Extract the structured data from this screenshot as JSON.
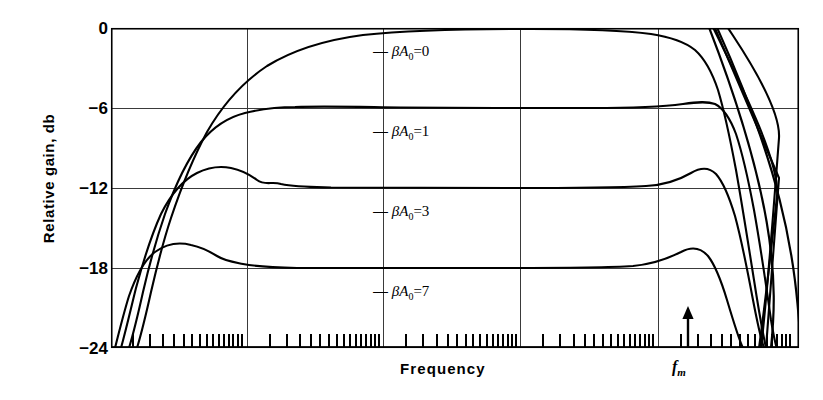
{
  "chart_data": {
    "type": "line",
    "title": "",
    "xlabel": "Frequency",
    "ylabel": "Relative gain, db",
    "x_scale": "log",
    "xlim": [
      0,
      1
    ],
    "ylim": [
      -24,
      0
    ],
    "yticks": [
      0,
      -6,
      -12,
      -18,
      -24
    ],
    "ytick_labels": [
      "0",
      "−6",
      "−12",
      "−18",
      "−24"
    ],
    "grid": "major gridlines on both axes; minor log ticks on x axis only",
    "legend": "inline curve labels placed at the right of each plateau",
    "annotations": [
      {
        "name": "fm-marker",
        "label": "f_m",
        "text": "f",
        "sub": "m",
        "arrow": "up",
        "x_px": 686,
        "note": "upward arrow at the resonance/cutoff frequency f sub m"
      }
    ],
    "series": [
      {
        "name": "−βA₀ = 0",
        "beta_a0": 0,
        "plateau_db": 0,
        "label": "−βA₀=0",
        "label_x_px": 373,
        "label_y_px": 42,
        "points_db": [
          {
            "x": 0.055,
            "y": -24.0
          },
          {
            "x": 0.075,
            "y": -18.0
          },
          {
            "x": 0.095,
            "y": -12.0
          },
          {
            "x": 0.12,
            "y": -7.0
          },
          {
            "x": 0.15,
            "y": -4.0
          },
          {
            "x": 0.2,
            "y": -1.8
          },
          {
            "x": 0.27,
            "y": -0.6
          },
          {
            "x": 0.36,
            "y": -0.1
          },
          {
            "x": 0.5,
            "y": 0.0
          },
          {
            "x": 0.65,
            "y": 0.0
          },
          {
            "x": 0.76,
            "y": -0.3
          },
          {
            "x": 0.81,
            "y": -1.2
          },
          {
            "x": 0.845,
            "y": -3.0
          },
          {
            "x": 0.872,
            "y": -6.0
          },
          {
            "x": 0.9,
            "y": -11.0
          },
          {
            "x": 0.93,
            "y": -18.0
          },
          {
            "x": 0.955,
            "y": -24.0
          }
        ]
      },
      {
        "name": "−βA₀ = 1",
        "beta_a0": 1,
        "plateau_db": -6,
        "label": "−βA₀=1",
        "label_x_px": 373,
        "label_y_px": 122,
        "points_db": [
          {
            "x": 0.05,
            "y": -24.0
          },
          {
            "x": 0.068,
            "y": -18.0
          },
          {
            "x": 0.086,
            "y": -12.0
          },
          {
            "x": 0.105,
            "y": -8.0
          },
          {
            "x": 0.125,
            "y": -6.3
          },
          {
            "x": 0.15,
            "y": -5.9
          },
          {
            "x": 0.2,
            "y": -5.9
          },
          {
            "x": 0.3,
            "y": -6.0
          },
          {
            "x": 0.5,
            "y": -6.0
          },
          {
            "x": 0.7,
            "y": -6.0
          },
          {
            "x": 0.78,
            "y": -5.9
          },
          {
            "x": 0.83,
            "y": -5.6
          },
          {
            "x": 0.862,
            "y": -6.2
          },
          {
            "x": 0.888,
            "y": -9.0
          },
          {
            "x": 0.91,
            "y": -14.0
          },
          {
            "x": 0.935,
            "y": -20.0
          },
          {
            "x": 0.952,
            "y": -24.0
          }
        ]
      },
      {
        "name": "−βA₀ = 3",
        "beta_a0": 3,
        "plateau_db": -12,
        "label": "−βA₀=3",
        "label_x_px": 373,
        "label_y_px": 202,
        "points_db": [
          {
            "x": 0.046,
            "y": -24.0
          },
          {
            "x": 0.062,
            "y": -18.0
          },
          {
            "x": 0.078,
            "y": -14.0
          },
          {
            "x": 0.092,
            "y": -11.2
          },
          {
            "x": 0.105,
            "y": -10.4
          },
          {
            "x": 0.12,
            "y": -10.5
          },
          {
            "x": 0.145,
            "y": -11.2
          },
          {
            "x": 0.19,
            "y": -11.8
          },
          {
            "x": 0.28,
            "y": -12.0
          },
          {
            "x": 0.5,
            "y": -12.0
          },
          {
            "x": 0.72,
            "y": -12.0
          },
          {
            "x": 0.79,
            "y": -11.6
          },
          {
            "x": 0.835,
            "y": -10.4
          },
          {
            "x": 0.862,
            "y": -10.6
          },
          {
            "x": 0.885,
            "y": -13.0
          },
          {
            "x": 0.905,
            "y": -17.0
          },
          {
            "x": 0.93,
            "y": -22.0
          },
          {
            "x": 0.945,
            "y": -24.0
          }
        ]
      },
      {
        "name": "−βA₀ = 7",
        "beta_a0": 7,
        "plateau_db": -18,
        "label": "−βA₀=7",
        "label_x_px": 373,
        "label_y_px": 282,
        "points_db": [
          {
            "x": 0.042,
            "y": -24.0
          },
          {
            "x": 0.056,
            "y": -20.0
          },
          {
            "x": 0.068,
            "y": -17.6
          },
          {
            "x": 0.08,
            "y": -16.8
          },
          {
            "x": 0.095,
            "y": -16.9
          },
          {
            "x": 0.115,
            "y": -17.4
          },
          {
            "x": 0.15,
            "y": -17.9
          },
          {
            "x": 0.22,
            "y": -18.0
          },
          {
            "x": 0.4,
            "y": -18.0
          },
          {
            "x": 0.65,
            "y": -18.0
          },
          {
            "x": 0.76,
            "y": -17.7
          },
          {
            "x": 0.82,
            "y": -16.9
          },
          {
            "x": 0.855,
            "y": -17.2
          },
          {
            "x": 0.88,
            "y": -19.5
          },
          {
            "x": 0.905,
            "y": -23.0
          },
          {
            "x": 0.918,
            "y": -24.0
          }
        ]
      },
      {
        "name": "resonant peak near f_m (left branch)",
        "beta_a0": null,
        "label": "",
        "note": "near-vertical rise through the top of the frame just left of f_m",
        "points_db": [
          {
            "x": 0.928,
            "y": -24.0
          },
          {
            "x": 0.944,
            "y": -12.0
          },
          {
            "x": 0.95,
            "y": -4.0
          },
          {
            "x": 0.953,
            "y": 0.0
          }
        ]
      },
      {
        "name": "resonant peak near f_m (right branch)",
        "beta_a0": null,
        "label": "",
        "note": "near-vertical fall from the top of the frame to the bottom right of f_m",
        "points_db": [
          {
            "x": 0.96,
            "y": 0.0
          },
          {
            "x": 0.963,
            "y": -6.0
          },
          {
            "x": 0.972,
            "y": -16.0
          },
          {
            "x": 0.982,
            "y": -24.0
          }
        ]
      }
    ]
  },
  "axis": {
    "x_major_gridlines_px": [
      247,
      383,
      520,
      658
    ],
    "x_minor_ticks_px": [
      133,
      150,
      163,
      174,
      184,
      192,
      200,
      207,
      213,
      219,
      224,
      229,
      233,
      238,
      242,
      270,
      287,
      300,
      311,
      320,
      329,
      337,
      344,
      350,
      356,
      361,
      366,
      371,
      375,
      379,
      406,
      423,
      437,
      448,
      457,
      466,
      473,
      480,
      487,
      493,
      498,
      503,
      508,
      512,
      516,
      543,
      560,
      574,
      585,
      594,
      603,
      611,
      618,
      624,
      630,
      635,
      640,
      645,
      649,
      653,
      681,
      698,
      711,
      722,
      731,
      740,
      748,
      755,
      761,
      767,
      772,
      777,
      782,
      786,
      790
    ]
  }
}
